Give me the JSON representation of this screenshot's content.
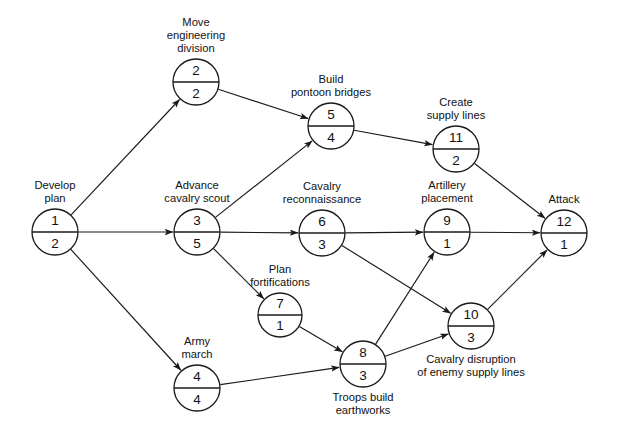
{
  "diagram": {
    "type": "activity-on-node network",
    "canvas": {
      "width": 620,
      "height": 438
    },
    "style": {
      "background": "#ffffff",
      "line_color": "#1a1a1a",
      "text_color": "#111111"
    }
  },
  "nodes": [
    {
      "id": "n1",
      "number": "1",
      "duration": "2",
      "label_lines": [
        "Develop",
        "plan"
      ],
      "label_position": "above",
      "cx": 55,
      "cy": 232,
      "r": 23
    },
    {
      "id": "n2",
      "number": "2",
      "duration": "2",
      "label_lines": [
        "Move",
        "engineering",
        "division"
      ],
      "label_position": "above",
      "cx": 196,
      "cy": 82,
      "r": 23
    },
    {
      "id": "n3",
      "number": "3",
      "duration": "5",
      "label_lines": [
        "Advance",
        "cavalry scout"
      ],
      "label_position": "above",
      "cx": 197,
      "cy": 232,
      "r": 23
    },
    {
      "id": "n4",
      "number": "4",
      "duration": "4",
      "label_lines": [
        "Army",
        "march"
      ],
      "label_position": "above",
      "cx": 197,
      "cy": 388,
      "r": 23
    },
    {
      "id": "n5",
      "number": "5",
      "duration": "4",
      "label_lines": [
        "Build",
        "pontoon bridges"
      ],
      "label_position": "above",
      "cx": 331,
      "cy": 126,
      "r": 23
    },
    {
      "id": "n6",
      "number": "6",
      "duration": "3",
      "label_lines": [
        "Cavalry",
        "reconnaissance"
      ],
      "label_position": "above",
      "cx": 322,
      "cy": 233,
      "r": 23
    },
    {
      "id": "n7",
      "number": "7",
      "duration": "1",
      "label_lines": [
        "Plan",
        "fortifications"
      ],
      "label_position": "above",
      "cx": 280,
      "cy": 315,
      "r": 22
    },
    {
      "id": "n8",
      "number": "8",
      "duration": "3",
      "label_lines": [
        "Troops build",
        "earthworks"
      ],
      "label_position": "below",
      "cx": 363,
      "cy": 364,
      "r": 23
    },
    {
      "id": "n9",
      "number": "9",
      "duration": "1",
      "label_lines": [
        "Artillery",
        "placement"
      ],
      "label_position": "above",
      "cx": 447,
      "cy": 232,
      "r": 23
    },
    {
      "id": "n10",
      "number": "10",
      "duration": "3",
      "label_lines": [
        "Cavalry disruption",
        "of enemy supply lines"
      ],
      "label_position": "below",
      "cx": 471,
      "cy": 326,
      "r": 23
    },
    {
      "id": "n11",
      "number": "11",
      "duration": "2",
      "label_lines": [
        "Create",
        "supply lines"
      ],
      "label_position": "above",
      "cx": 456,
      "cy": 149,
      "r": 23
    },
    {
      "id": "n12",
      "number": "12",
      "duration": "1",
      "label_lines": [
        "Attack"
      ],
      "label_position": "above",
      "cx": 564,
      "cy": 233,
      "r": 23
    }
  ],
  "edges": [
    {
      "id": "e1-2",
      "from": "n1",
      "to": "n2"
    },
    {
      "id": "e1-3",
      "from": "n1",
      "to": "n3"
    },
    {
      "id": "e1-4",
      "from": "n1",
      "to": "n4"
    },
    {
      "id": "e2-5",
      "from": "n2",
      "to": "n5"
    },
    {
      "id": "e3-5",
      "from": "n3",
      "to": "n5"
    },
    {
      "id": "e3-6",
      "from": "n3",
      "to": "n6"
    },
    {
      "id": "e3-7",
      "from": "n3",
      "to": "n7"
    },
    {
      "id": "e5-11",
      "from": "n5",
      "to": "n11"
    },
    {
      "id": "e6-9",
      "from": "n6",
      "to": "n9"
    },
    {
      "id": "e6-10",
      "from": "n6",
      "to": "n10"
    },
    {
      "id": "e7-8",
      "from": "n7",
      "to": "n8"
    },
    {
      "id": "e4-8",
      "from": "n4",
      "to": "n8"
    },
    {
      "id": "e8-9",
      "from": "n8",
      "to": "n9"
    },
    {
      "id": "e8-10",
      "from": "n8",
      "to": "n10"
    },
    {
      "id": "e9-12",
      "from": "n9",
      "to": "n12"
    },
    {
      "id": "e10-12",
      "from": "n10",
      "to": "n12"
    },
    {
      "id": "e11-12",
      "from": "n11",
      "to": "n12"
    }
  ]
}
